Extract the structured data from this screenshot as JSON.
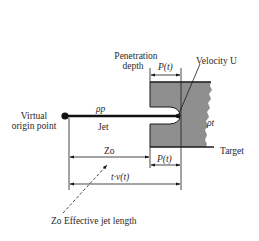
{
  "diagram": {
    "type": "schematic",
    "colors": {
      "target_fill": "#8f8f8f",
      "line": "#1a1a1a",
      "background": "#ffffff"
    },
    "labels": {
      "virtual_origin": [
        "Virtual",
        "origin point"
      ],
      "jet_density": "ρp",
      "jet": "Jet",
      "penetration_depth": [
        "Penetration",
        "depth"
      ],
      "p_t_top": "P(t)",
      "velocity": "Velocity U",
      "target_density": "ρt",
      "target": "Target",
      "z_o": "Zo",
      "p_t_bottom": "P(t)",
      "t_v_t": "t·v(t)",
      "effective_jet_length": "Zo Effective jet length"
    }
  }
}
